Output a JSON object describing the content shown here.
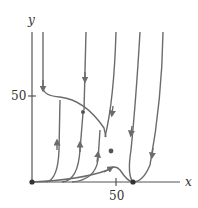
{
  "diagram": {
    "type": "phase-plane",
    "axes": {
      "x_label": "x",
      "y_label": "y",
      "x_tick_label": "50",
      "y_tick_label": "50"
    },
    "colors": {
      "curve": "#6b6b6b",
      "axis": "#555555",
      "point": "#333333"
    },
    "equilibrium_points": [
      {
        "label": "origin",
        "x": 0,
        "y": 0
      },
      {
        "label": "x-axis point",
        "x": 60,
        "y": 0
      },
      {
        "label": "interior point",
        "x": 45,
        "y": 19
      }
    ]
  }
}
